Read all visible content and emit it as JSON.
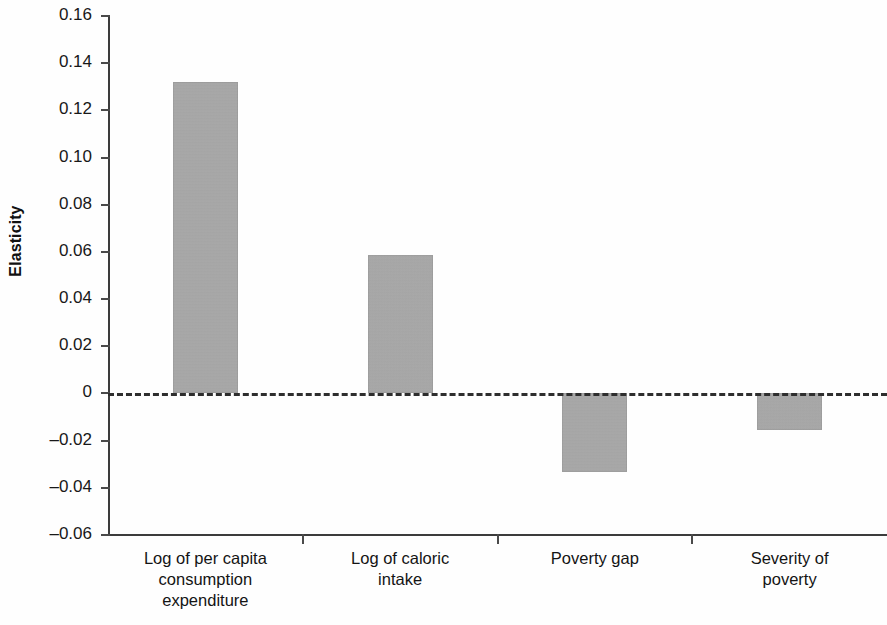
{
  "chart_data": {
    "type": "bar",
    "title": "",
    "xlabel": "",
    "ylabel": "Elasticity",
    "categories": [
      "Log of per capita consumption expenditure",
      "Log of caloric intake",
      "Poverty gap",
      "Severity of poverty"
    ],
    "category_lines": [
      [
        "Log of per capita",
        "consumption",
        "expenditure"
      ],
      [
        "Log of caloric",
        "intake"
      ],
      [
        "Poverty gap"
      ],
      [
        "Severity of",
        "poverty"
      ]
    ],
    "values": [
      0.132,
      0.0585,
      -0.0335,
      -0.0155
    ],
    "ylim": [
      -0.06,
      0.16
    ],
    "ytick_values": [
      0.16,
      0.14,
      0.12,
      0.1,
      0.08,
      0.06,
      0.04,
      0.02,
      0,
      -0.02,
      -0.04,
      -0.06
    ],
    "ytick_labels": [
      "0.16",
      "0.14",
      "0.12",
      "0.10",
      "0.08",
      "0.06",
      "0.04",
      "0.02",
      "0",
      "–0.02",
      "–0.04",
      "–0.06"
    ],
    "grid": false,
    "legend": false,
    "zero_reference_line": true,
    "bar_color": "#aaaaaa",
    "axis_color": "#3c3c3c"
  }
}
